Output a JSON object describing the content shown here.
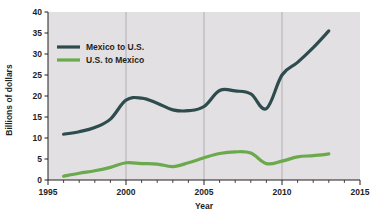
{
  "chart_data": {
    "type": "line",
    "title": "",
    "xlabel": "Year",
    "ylabel": "Billions of dollars",
    "xlim": [
      1995,
      2015
    ],
    "ylim": [
      0,
      40
    ],
    "xticks": [
      1995,
      2000,
      2005,
      2010,
      2015
    ],
    "xtick_labels": [
      "1995",
      "2000",
      "2005",
      "2010",
      "2015"
    ],
    "yticks": [
      0,
      5,
      10,
      15,
      20,
      25,
      30,
      35,
      40
    ],
    "ytick_labels": [
      "0",
      "5",
      "10",
      "15",
      "20",
      "25",
      "30",
      "35",
      "40"
    ],
    "minor_xtick_interval": 1,
    "grid": "vertical-major-only",
    "legend_position": "upper-left-inside",
    "plot_background": "#e2e0e2",
    "x": [
      1996,
      1997,
      1998,
      1999,
      2000,
      2001,
      2002,
      2003,
      2004,
      2005,
      2006,
      2007,
      2008,
      2009,
      2010,
      2011,
      2012,
      2013
    ],
    "series": [
      {
        "name": "Mexico to U.S.",
        "color": "#2e4c4e",
        "values": [
          10.9,
          11.5,
          12.5,
          14.5,
          19.0,
          19.5,
          18.3,
          16.7,
          16.5,
          17.5,
          21.3,
          21.2,
          20.5,
          17.0,
          25.0,
          28.0,
          31.5,
          35.5
        ]
      },
      {
        "name": "U.S. to Mexico",
        "color": "#6aa94c",
        "values": [
          0.9,
          1.6,
          2.2,
          3.0,
          4.1,
          3.9,
          3.8,
          3.2,
          4.1,
          5.3,
          6.3,
          6.7,
          6.4,
          3.9,
          4.5,
          5.5,
          5.8,
          6.2
        ]
      }
    ]
  },
  "legend": {
    "items": [
      {
        "label": "Mexico to U.S.",
        "color": "#2e4c4e"
      },
      {
        "label": "U.S. to Mexico",
        "color": "#6aa94c"
      }
    ]
  },
  "axes": {
    "x_title": "Year",
    "y_title": "Billions of dollars"
  },
  "colors": {
    "series_mexico_to_us": "#2e4c4e",
    "series_us_to_mexico": "#6aa94c",
    "plot_background": "#e2e0e2",
    "axis": "#221f1f",
    "gridline": "#9b9a9e",
    "page_background": "#ffffff"
  }
}
